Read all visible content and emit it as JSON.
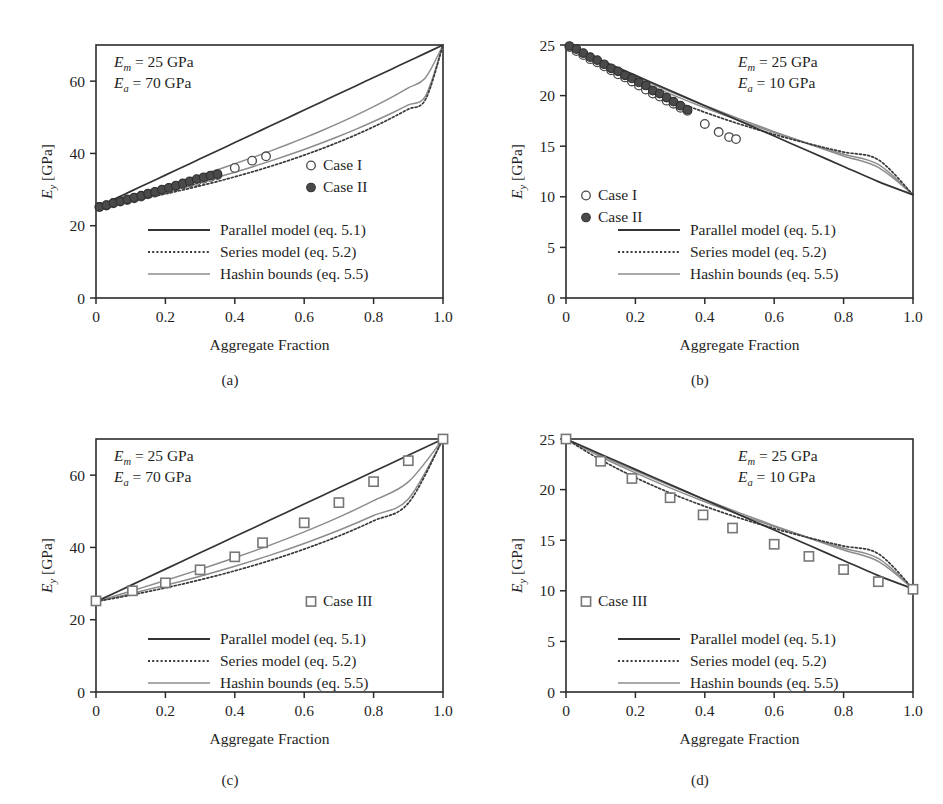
{
  "figure": {
    "panels": [
      "a",
      "b",
      "c",
      "d"
    ],
    "captions": {
      "a": "(a)",
      "b": "(b)",
      "c": "(c)",
      "d": "(d)"
    },
    "axis": {
      "xlabel": "Aggregate Fraction",
      "ylabel_main": "E",
      "ylabel_sub": "y",
      "ylabel_unit": " [GPa]"
    },
    "legend": {
      "parallel": "Parallel model (eq. 5.1)",
      "series": "Series model (eq. 5.2)",
      "hashin": "Hashin bounds (eq. 5.5)",
      "case1": "Case I",
      "case2": "Case II",
      "case3": "Case III"
    },
    "annotations": {
      "Em_symbol": "E",
      "Em_sub": "m",
      "Em_value": " = 25 GPa",
      "Ea_symbol": "E",
      "Ea_sub": "a",
      "Ea_value_70": " = 70 GPa",
      "Ea_value_10": " = 10 GPa"
    },
    "colors": {
      "parallel": "#333333",
      "series": "#3a3a3a",
      "hashin": "#8c8c8c",
      "marker_open": "#ffffff",
      "marker_filled": "#4a4a4a",
      "marker_square": "#9a9a9a",
      "axis": "#2b2b2b",
      "text": "#1f1f1f"
    }
  },
  "chart_data": [
    {
      "id": "a",
      "type": "line",
      "title": "(a)",
      "xlabel": "Aggregate Fraction",
      "ylabel": "Ey [GPa]",
      "xlim": [
        0,
        1
      ],
      "ylim": [
        0,
        70
      ],
      "xticks": [
        0,
        0.2,
        0.4,
        0.6,
        0.8,
        1.0
      ],
      "xticklabels": [
        "0",
        "0.2",
        "0.4",
        "0.6",
        "0.8",
        "1.0"
      ],
      "yticks": [
        0,
        20,
        40,
        60
      ],
      "yticklabels": [
        "0",
        "20",
        "40",
        "60"
      ],
      "grid": false,
      "legend_position": "lower-center",
      "annotations": [
        "Em = 25 GPa",
        "Ea = 70 GPa"
      ],
      "params": {
        "Em": 25,
        "Ea": 70
      },
      "series": [
        {
          "name": "Parallel model (eq. 5.1)",
          "style": "solid-dark",
          "x": [
            0,
            0.05,
            0.1,
            0.15,
            0.2,
            0.25,
            0.3,
            0.35,
            0.4,
            0.45,
            0.5,
            0.55,
            0.6,
            0.65,
            0.7,
            0.75,
            0.8,
            0.85,
            0.9,
            0.95,
            1.0
          ],
          "values": [
            25,
            27.25,
            29.5,
            31.75,
            34,
            36.25,
            38.5,
            40.75,
            43,
            45.25,
            47.5,
            49.75,
            52,
            54.25,
            56.5,
            58.75,
            61,
            63.25,
            65.5,
            67.75,
            70
          ]
        },
        {
          "name": "Series model (eq. 5.2)",
          "style": "dotted-dark",
          "x": [
            0,
            0.05,
            0.1,
            0.15,
            0.2,
            0.25,
            0.3,
            0.35,
            0.4,
            0.45,
            0.5,
            0.55,
            0.6,
            0.65,
            0.7,
            0.75,
            0.8,
            0.85,
            0.9,
            0.95,
            1.0
          ],
          "values": [
            25,
            25.88,
            26.81,
            27.78,
            28.81,
            29.89,
            31.03,
            32.24,
            33.53,
            34.89,
            36.34,
            37.88,
            39.53,
            41.29,
            43.17,
            45.19,
            47.37,
            49.72,
            52.25,
            55.0,
            70
          ]
        },
        {
          "name": "Hashin lower bound (eq. 5.5)",
          "style": "solid-gray",
          "x": [
            0,
            0.05,
            0.1,
            0.15,
            0.2,
            0.25,
            0.3,
            0.35,
            0.4,
            0.45,
            0.5,
            0.55,
            0.6,
            0.65,
            0.7,
            0.75,
            0.8,
            0.85,
            0.9,
            0.95,
            1.0
          ],
          "values": [
            25,
            26.07,
            27.18,
            28.33,
            29.52,
            30.76,
            32.05,
            33.4,
            34.8,
            36.27,
            37.8,
            39.41,
            41.1,
            42.88,
            44.75,
            46.73,
            48.83,
            51.05,
            53.42,
            55.95,
            70
          ]
        },
        {
          "name": "Hashin upper bound (eq. 5.5)",
          "style": "solid-gray",
          "x": [
            0,
            0.05,
            0.1,
            0.15,
            0.2,
            0.25,
            0.3,
            0.35,
            0.4,
            0.45,
            0.5,
            0.55,
            0.6,
            0.65,
            0.7,
            0.75,
            0.8,
            0.85,
            0.9,
            0.95,
            1.0
          ],
          "values": [
            25,
            26.45,
            27.9,
            29.37,
            30.85,
            32.37,
            33.92,
            35.5,
            37.14,
            38.83,
            40.58,
            42.4,
            44.3,
            46.29,
            48.38,
            50.59,
            52.94,
            55.44,
            58.13,
            61.03,
            70
          ]
        },
        {
          "name": "Case I",
          "style": "marker-open-circle",
          "x": [
            0.01,
            0.03,
            0.05,
            0.07,
            0.09,
            0.11,
            0.13,
            0.15,
            0.17,
            0.19,
            0.21,
            0.23,
            0.25,
            0.27,
            0.29,
            0.31,
            0.33,
            0.35,
            0.4,
            0.45,
            0.49
          ],
          "values": [
            25.2,
            25.6,
            26.2,
            26.7,
            27.1,
            27.6,
            28.1,
            28.7,
            29.2,
            29.8,
            30.3,
            30.9,
            31.4,
            31.9,
            32.4,
            33.0,
            33.5,
            34.0,
            36.0,
            38.0,
            39.2
          ]
        },
        {
          "name": "Case II",
          "style": "marker-filled-circle",
          "x": [
            0.01,
            0.03,
            0.05,
            0.07,
            0.09,
            0.11,
            0.13,
            0.15,
            0.17,
            0.19,
            0.21,
            0.23,
            0.25,
            0.27,
            0.29,
            0.31,
            0.33,
            0.35
          ],
          "values": [
            25.2,
            25.7,
            26.3,
            26.8,
            27.3,
            27.8,
            28.3,
            28.9,
            29.4,
            30.0,
            30.5,
            31.1,
            31.7,
            32.3,
            32.9,
            33.4,
            33.9,
            34.3
          ]
        }
      ]
    },
    {
      "id": "b",
      "type": "line",
      "title": "(b)",
      "xlabel": "Aggregate Fraction",
      "ylabel": "Ey [GPa]",
      "xlim": [
        0,
        1
      ],
      "ylim": [
        0,
        25
      ],
      "xticks": [
        0,
        0.2,
        0.4,
        0.6,
        0.8,
        1.0
      ],
      "xticklabels": [
        "0",
        "0.2",
        "0.4",
        "0.6",
        "0.8",
        "1.0"
      ],
      "yticks": [
        0,
        5,
        10,
        15,
        20,
        25
      ],
      "yticklabels": [
        "0",
        "5",
        "10",
        "15",
        "20",
        "25"
      ],
      "grid": false,
      "legend_position": "lower-center",
      "annotations": [
        "Em = 25 GPa",
        "Ea = 10 GPa"
      ],
      "params": {
        "Em": 25,
        "Ea": 10
      },
      "series": [
        {
          "name": "Parallel model (eq. 5.1)",
          "style": "solid-dark",
          "x": [
            0,
            0.1,
            0.2,
            0.3,
            0.4,
            0.5,
            0.6,
            0.7,
            0.8,
            0.9,
            1.0
          ],
          "values": [
            25,
            23.5,
            22,
            20.5,
            19,
            17.5,
            16,
            14.5,
            13,
            11.5,
            10.2
          ]
        },
        {
          "name": "Series model (eq. 5.2)",
          "style": "dotted-dark",
          "x": [
            0,
            0.1,
            0.2,
            0.3,
            0.4,
            0.5,
            0.6,
            0.7,
            0.8,
            0.9,
            1.0
          ],
          "values": [
            25,
            22.94,
            21.19,
            19.67,
            18.35,
            17.19,
            16.16,
            15.24,
            14.42,
            13.66,
            10.2
          ]
        },
        {
          "name": "Hashin lower bound (eq. 5.5)",
          "style": "solid-gray",
          "x": [
            0,
            0.1,
            0.2,
            0.3,
            0.4,
            0.5,
            0.6,
            0.7,
            0.8,
            0.9,
            1.0
          ],
          "values": [
            25,
            23.25,
            21.65,
            20.17,
            18.8,
            17.53,
            16.35,
            15.25,
            14.21,
            13.2,
            10.2
          ]
        },
        {
          "name": "Hashin upper bound (eq. 5.5)",
          "style": "solid-gray",
          "x": [
            0,
            0.1,
            0.2,
            0.3,
            0.4,
            0.5,
            0.6,
            0.7,
            0.8,
            0.9,
            1.0
          ],
          "values": [
            25,
            23.38,
            21.85,
            20.4,
            19.02,
            17.7,
            16.44,
            15.22,
            14.04,
            12.9,
            10.2
          ]
        },
        {
          "name": "Case I",
          "style": "marker-open-circle",
          "x": [
            0.01,
            0.03,
            0.05,
            0.07,
            0.09,
            0.11,
            0.13,
            0.15,
            0.17,
            0.19,
            0.21,
            0.23,
            0.25,
            0.27,
            0.29,
            0.31,
            0.33,
            0.35,
            0.4,
            0.44,
            0.47,
            0.49
          ],
          "values": [
            24.8,
            24.4,
            24.0,
            23.6,
            23.3,
            22.9,
            22.5,
            22.1,
            21.8,
            21.4,
            21.0,
            20.6,
            20.2,
            19.9,
            19.5,
            19.2,
            18.8,
            18.5,
            17.2,
            16.4,
            15.9,
            15.7
          ]
        },
        {
          "name": "Case II",
          "style": "marker-filled-circle",
          "x": [
            0.01,
            0.03,
            0.05,
            0.07,
            0.09,
            0.11,
            0.13,
            0.15,
            0.17,
            0.19,
            0.21,
            0.23,
            0.25,
            0.27,
            0.29,
            0.31,
            0.33,
            0.35
          ],
          "values": [
            24.9,
            24.6,
            24.2,
            23.8,
            23.5,
            23.1,
            22.7,
            22.4,
            22.0,
            21.7,
            21.3,
            21.0,
            20.5,
            20.2,
            19.8,
            19.4,
            19.0,
            18.6
          ]
        }
      ]
    },
    {
      "id": "c",
      "type": "line",
      "title": "(c)",
      "xlabel": "Aggregate Fraction",
      "ylabel": "Ey [GPa]",
      "xlim": [
        0,
        1
      ],
      "ylim": [
        0,
        70
      ],
      "xticks": [
        0,
        0.2,
        0.4,
        0.6,
        0.8,
        1.0
      ],
      "xticklabels": [
        "0",
        "0.2",
        "0.4",
        "0.6",
        "0.8",
        "1.0"
      ],
      "yticks": [
        0,
        20,
        40,
        60
      ],
      "yticklabels": [
        "0",
        "20",
        "40",
        "60"
      ],
      "grid": false,
      "legend_position": "lower-center",
      "annotations": [
        "Em = 25 GPa",
        "Ea = 70 GPa"
      ],
      "params": {
        "Em": 25,
        "Ea": 70
      },
      "series": [
        {
          "name": "Parallel model (eq. 5.1)",
          "style": "solid-dark",
          "x": [
            0,
            0.1,
            0.2,
            0.3,
            0.4,
            0.5,
            0.6,
            0.7,
            0.8,
            0.9,
            1.0
          ],
          "values": [
            25,
            29.5,
            34,
            38.5,
            43,
            47.5,
            52,
            56.5,
            61,
            65.5,
            70
          ]
        },
        {
          "name": "Series model (eq. 5.2)",
          "style": "dotted-dark",
          "x": [
            0,
            0.1,
            0.2,
            0.3,
            0.4,
            0.5,
            0.6,
            0.7,
            0.8,
            0.9,
            1.0
          ],
          "values": [
            25,
            26.81,
            28.81,
            31.03,
            33.53,
            36.34,
            39.53,
            43.17,
            47.37,
            52.25,
            70
          ]
        },
        {
          "name": "Hashin lower bound (eq. 5.5)",
          "style": "solid-gray",
          "x": [
            0,
            0.1,
            0.2,
            0.3,
            0.4,
            0.5,
            0.6,
            0.7,
            0.8,
            0.9,
            1.0
          ],
          "values": [
            25,
            27.18,
            29.52,
            32.05,
            34.8,
            37.8,
            41.1,
            44.75,
            48.83,
            53.42,
            70
          ]
        },
        {
          "name": "Hashin upper bound (eq. 5.5)",
          "style": "solid-gray",
          "x": [
            0,
            0.1,
            0.2,
            0.3,
            0.4,
            0.5,
            0.6,
            0.7,
            0.8,
            0.9,
            1.0
          ],
          "values": [
            25,
            27.9,
            30.85,
            33.92,
            37.14,
            40.58,
            44.3,
            48.38,
            52.94,
            58.13,
            70
          ]
        },
        {
          "name": "Case III",
          "style": "marker-open-square",
          "x": [
            0.0,
            0.105,
            0.2,
            0.3,
            0.4,
            0.48,
            0.6,
            0.7,
            0.8,
            0.9,
            1.0
          ],
          "values": [
            25.2,
            28.0,
            30.2,
            33.8,
            37.4,
            41.3,
            46.8,
            52.4,
            58.2,
            64.0,
            70.0
          ]
        }
      ]
    },
    {
      "id": "d",
      "type": "line",
      "title": "(d)",
      "xlabel": "Aggregate Fraction",
      "ylabel": "Ey [GPa]",
      "xlim": [
        0,
        1
      ],
      "ylim": [
        0,
        25
      ],
      "xticks": [
        0,
        0.2,
        0.4,
        0.6,
        0.8,
        1.0
      ],
      "xticklabels": [
        "0",
        "0.2",
        "0.4",
        "0.6",
        "0.8",
        "1.0"
      ],
      "yticks": [
        0,
        5,
        10,
        15,
        20,
        25
      ],
      "yticklabels": [
        "0",
        "5",
        "10",
        "15",
        "20",
        "25"
      ],
      "grid": false,
      "legend_position": "lower-center",
      "annotations": [
        "Em = 25 GPa",
        "Ea = 10 GPa"
      ],
      "params": {
        "Em": 25,
        "Ea": 10
      },
      "series": [
        {
          "name": "Parallel model (eq. 5.1)",
          "style": "solid-dark",
          "x": [
            0,
            0.1,
            0.2,
            0.3,
            0.4,
            0.5,
            0.6,
            0.7,
            0.8,
            0.9,
            1.0
          ],
          "values": [
            25,
            23.5,
            22,
            20.5,
            19,
            17.5,
            16,
            14.5,
            13,
            11.5,
            10.2
          ]
        },
        {
          "name": "Series model (eq. 5.2)",
          "style": "dotted-dark",
          "x": [
            0,
            0.1,
            0.2,
            0.3,
            0.4,
            0.5,
            0.6,
            0.7,
            0.8,
            0.9,
            1.0
          ],
          "values": [
            25,
            22.94,
            21.19,
            19.67,
            18.35,
            17.19,
            16.16,
            15.24,
            14.42,
            13.66,
            10.2
          ]
        },
        {
          "name": "Hashin lower bound (eq. 5.5)",
          "style": "solid-gray",
          "x": [
            0,
            0.1,
            0.2,
            0.3,
            0.4,
            0.5,
            0.6,
            0.7,
            0.8,
            0.9,
            1.0
          ],
          "values": [
            25,
            23.25,
            21.65,
            20.17,
            18.8,
            17.53,
            16.35,
            15.25,
            14.21,
            13.2,
            10.2
          ]
        },
        {
          "name": "Hashin upper bound (eq. 5.5)",
          "style": "solid-gray",
          "x": [
            0,
            0.1,
            0.2,
            0.3,
            0.4,
            0.5,
            0.6,
            0.7,
            0.8,
            0.9,
            1.0
          ],
          "values": [
            25,
            23.38,
            21.85,
            20.4,
            19.02,
            17.7,
            16.44,
            15.22,
            14.04,
            12.9,
            10.2
          ]
        },
        {
          "name": "Case III",
          "style": "marker-open-square",
          "x": [
            0.0,
            0.1,
            0.19,
            0.3,
            0.395,
            0.48,
            0.6,
            0.7,
            0.8,
            0.9,
            1.0
          ],
          "values": [
            25.0,
            22.8,
            21.1,
            19.2,
            17.5,
            16.2,
            14.6,
            13.4,
            12.1,
            10.9,
            10.15
          ]
        }
      ]
    }
  ]
}
